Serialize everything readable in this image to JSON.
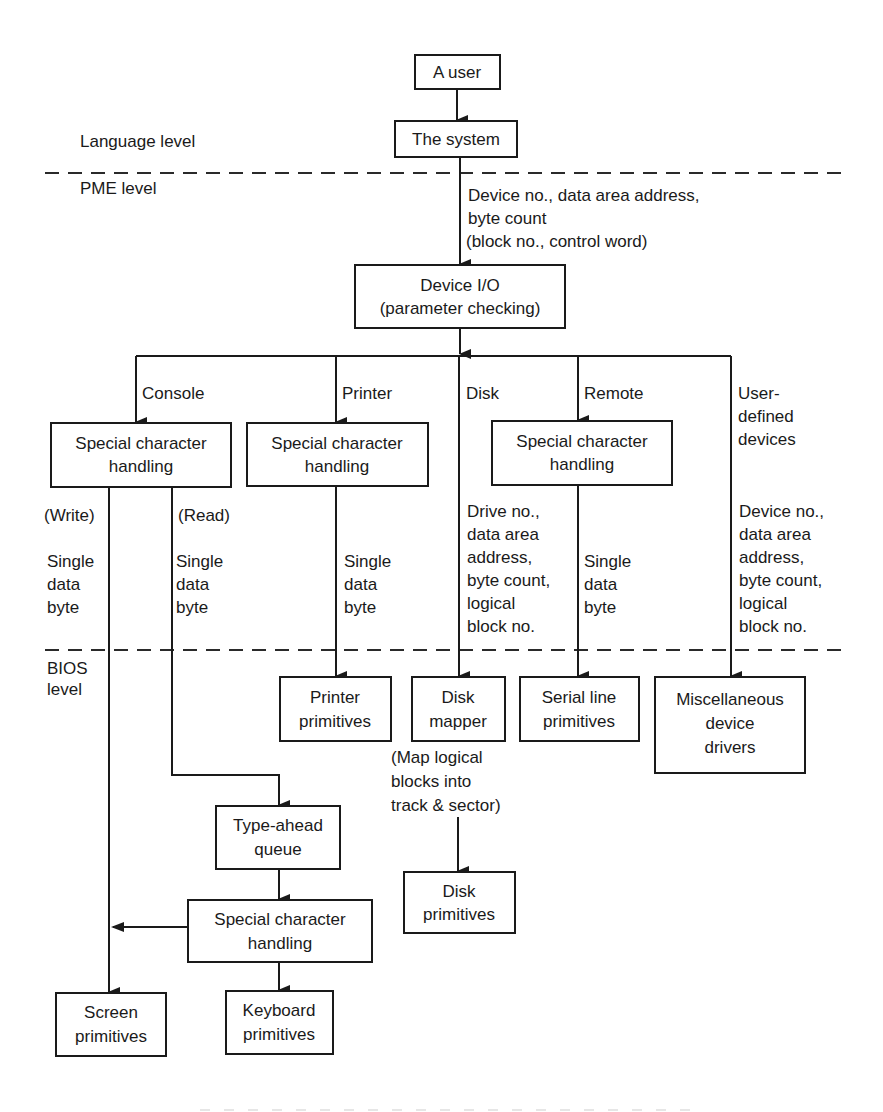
{
  "levels": {
    "language": "Language level",
    "pme": "PME level",
    "bios_line1": "BIOS",
    "bios_line2": "level"
  },
  "nodes": {
    "user": "A user",
    "system": "The system",
    "device_io": [
      "Device I/O",
      "(parameter checking)"
    ],
    "console_sch": [
      "Special character",
      "handling"
    ],
    "printer_sch": [
      "Special character",
      "handling"
    ],
    "remote_sch": [
      "Special character",
      "handling"
    ],
    "printer_prims": [
      "Printer",
      "primitives"
    ],
    "disk_mapper": [
      "Disk",
      "mapper"
    ],
    "serial_prims": [
      "Serial line",
      "primitives"
    ],
    "misc_drivers": [
      "Miscellaneous",
      "device",
      "drivers"
    ],
    "type_ahead": [
      "Type-ahead",
      "queue"
    ],
    "keyboard_sch": [
      "Special character",
      "handling"
    ],
    "disk_prims": [
      "Disk",
      "primitives"
    ],
    "screen_prims": [
      "Screen",
      "primitives"
    ],
    "keyboard_prims": [
      "Keyboard",
      "primitives"
    ]
  },
  "edge_labels": {
    "system_to_io": [
      "Device no., data area address,",
      "byte count",
      "(block no., control word)"
    ],
    "console": "Console",
    "printer": "Printer",
    "disk": "Disk",
    "remote": "Remote",
    "user_defined": [
      "User-",
      "defined",
      "devices"
    ],
    "write": "(Write)",
    "read": "(Read)",
    "write_data": [
      "Single",
      "data",
      "byte"
    ],
    "read_data": [
      "Single",
      "data",
      "byte"
    ],
    "printer_data": [
      "Single",
      "data",
      "byte"
    ],
    "disk_data": [
      "Drive no.,",
      "data area",
      "address,",
      "byte count,",
      "logical",
      "block no."
    ],
    "remote_data": [
      "Single",
      "data",
      "byte"
    ],
    "user_data": [
      "Device no.,",
      "data area",
      "address,",
      "byte count,",
      "logical",
      "block no."
    ],
    "disk_mapper_note": [
      "(Map logical",
      "blocks into",
      "track & sector)"
    ]
  }
}
